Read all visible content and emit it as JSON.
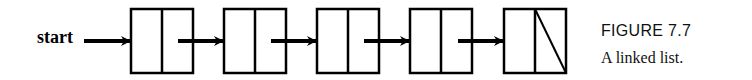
{
  "diagram": {
    "start_label": "start",
    "nodes": [
      {
        "index": 0,
        "next": "pointer"
      },
      {
        "index": 1,
        "next": "pointer"
      },
      {
        "index": 2,
        "next": "pointer"
      },
      {
        "index": 3,
        "next": "pointer"
      },
      {
        "index": 4,
        "next": "null"
      }
    ]
  },
  "figure": {
    "title": "FIGURE 7.7",
    "caption": "A linked list."
  }
}
